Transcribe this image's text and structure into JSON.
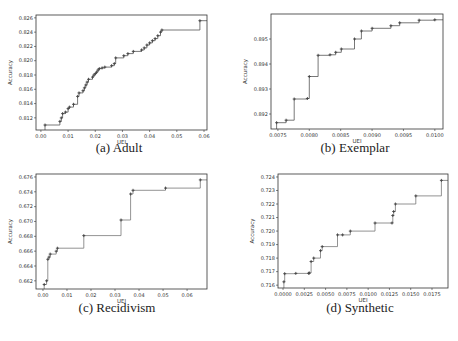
{
  "figure": {
    "panels": [
      {
        "id": "a",
        "caption": "(a) Adult",
        "xlabel": "UEI",
        "ylabel": "Accuracy"
      },
      {
        "id": "b",
        "caption": "(b) Exemplar",
        "xlabel": "UEI",
        "ylabel": "Accuracy"
      },
      {
        "id": "c",
        "caption": "(c) Recidivism",
        "xlabel": "UEI",
        "ylabel": "Accuracy"
      },
      {
        "id": "d",
        "caption": "(d) Synthetic",
        "xlabel": "UEI",
        "ylabel": "Accuracy"
      }
    ]
  },
  "chart_data": [
    {
      "type": "line",
      "step": "post",
      "markers": true,
      "title": "(a) Adult",
      "xlabel": "UEI",
      "ylabel": "Accuracy",
      "xlim": [
        -0.0018,
        0.0611
      ],
      "ylim": [
        0.8103,
        0.8264
      ],
      "xticks": [
        0.0,
        0.01,
        0.02,
        0.03,
        0.04,
        0.05,
        0.06
      ],
      "xtick_labels": [
        "0.00",
        "0.01",
        "0.02",
        "0.03",
        "0.04",
        "0.05",
        "0.06"
      ],
      "yticks": [
        0.812,
        0.814,
        0.816,
        0.818,
        0.82,
        0.822,
        0.824,
        0.826
      ],
      "ytick_labels": [
        "0.812",
        "0.814",
        "0.816",
        "0.818",
        "0.820",
        "0.822",
        "0.824",
        "0.826"
      ],
      "grid": false,
      "color": "#555555",
      "x": [
        0.0015,
        0.007,
        0.0075,
        0.008,
        0.009,
        0.01,
        0.0105,
        0.012,
        0.0135,
        0.014,
        0.0155,
        0.016,
        0.0165,
        0.017,
        0.0175,
        0.019,
        0.0195,
        0.02,
        0.0205,
        0.021,
        0.0215,
        0.0225,
        0.0235,
        0.026,
        0.027,
        0.0275,
        0.0305,
        0.032,
        0.034,
        0.037,
        0.038,
        0.039,
        0.04,
        0.041,
        0.042,
        0.043,
        0.044,
        0.0445,
        0.0585,
        0.0611
      ],
      "y": [
        0.811,
        0.8115,
        0.812,
        0.8126,
        0.8128,
        0.8133,
        0.8135,
        0.8139,
        0.815,
        0.8155,
        0.8158,
        0.8162,
        0.8166,
        0.817,
        0.8174,
        0.8177,
        0.818,
        0.8182,
        0.8184,
        0.8187,
        0.8189,
        0.819,
        0.8191,
        0.8193,
        0.8196,
        0.8204,
        0.8207,
        0.821,
        0.8213,
        0.8215,
        0.8218,
        0.8222,
        0.8225,
        0.8228,
        0.8231,
        0.8235,
        0.824,
        0.8243,
        0.8256,
        0.8256
      ]
    },
    {
      "type": "line",
      "step": "post",
      "markers": true,
      "title": "(b) Exemplar",
      "xlabel": "UEI",
      "ylabel": "Accuracy",
      "xlim": [
        0.00739,
        0.01013
      ],
      "ylim": [
        0.8914,
        0.896
      ],
      "xticks": [
        0.0075,
        0.008,
        0.0085,
        0.009,
        0.0095,
        0.01
      ],
      "xtick_labels": [
        "0.0075",
        "0.0080",
        "0.0085",
        "0.0090",
        "0.0095",
        "0.0100"
      ],
      "yticks": [
        0.892,
        0.893,
        0.894,
        0.895
      ],
      "ytick_labels": [
        "0.892",
        "0.893",
        "0.894",
        "0.895"
      ],
      "grid": false,
      "color": "#555555",
      "x": [
        0.00748,
        0.00763,
        0.00776,
        0.00797,
        0.008,
        0.00814,
        0.00833,
        0.00842,
        0.00851,
        0.00872,
        0.00883,
        0.009,
        0.0093,
        0.00944,
        0.00975,
        0.01,
        0.01013
      ],
      "y": [
        0.89165,
        0.89175,
        0.8926,
        0.89262,
        0.8935,
        0.89435,
        0.89437,
        0.89447,
        0.8946,
        0.895,
        0.89532,
        0.89543,
        0.89553,
        0.89565,
        0.89575,
        0.89577,
        0.89577
      ]
    },
    {
      "type": "line",
      "step": "post",
      "markers": true,
      "title": "(c) Recidivism",
      "xlabel": "UEI",
      "ylabel": "Accuracy",
      "xlim": [
        -0.0029,
        0.0683
      ],
      "ylim": [
        0.6609,
        0.6764
      ],
      "xticks": [
        0.0,
        0.01,
        0.02,
        0.03,
        0.04,
        0.05,
        0.06
      ],
      "xtick_labels": [
        "0.00",
        "0.01",
        "0.02",
        "0.03",
        "0.04",
        "0.05",
        "0.06"
      ],
      "yticks": [
        0.662,
        0.664,
        0.666,
        0.668,
        0.67,
        0.672,
        0.674,
        0.676
      ],
      "ytick_labels": [
        "0.662",
        "0.664",
        "0.666",
        "0.668",
        "0.670",
        "0.672",
        "0.674",
        "0.676"
      ],
      "grid": false,
      "color": "#777777",
      "x": [
        0.0005,
        0.0015,
        0.002,
        0.0025,
        0.003,
        0.0055,
        0.006,
        0.017,
        0.0325,
        0.0365,
        0.0375,
        0.051,
        0.0655,
        0.0683
      ],
      "y": [
        0.6615,
        0.662,
        0.6649,
        0.6652,
        0.6656,
        0.666,
        0.6664,
        0.6681,
        0.6702,
        0.6737,
        0.6742,
        0.6745,
        0.6756,
        0.6756
      ]
    },
    {
      "type": "line",
      "step": "post",
      "markers": true,
      "title": "(d) Synthetic",
      "xlabel": "UEI",
      "ylabel": "Accuracy",
      "xlim": [
        -0.00059,
        0.01938
      ],
      "ylim": [
        0.71579,
        0.72422
      ],
      "xticks": [
        0.0,
        0.0025,
        0.005,
        0.0075,
        0.01,
        0.0125,
        0.015,
        0.0175
      ],
      "xtick_labels": [
        "0.0000",
        "0.0025",
        "0.0050",
        "0.0075",
        "0.0100",
        "0.0125",
        "0.0150",
        "0.0175"
      ],
      "yticks": [
        0.716,
        0.717,
        0.718,
        0.719,
        0.72,
        0.721,
        0.722,
        0.723,
        0.724
      ],
      "ytick_labels": [
        "0.716",
        "0.717",
        "0.718",
        "0.719",
        "0.720",
        "0.721",
        "0.722",
        "0.723",
        "0.724"
      ],
      "grid": false,
      "color": "#777777",
      "x": [
        0.0001,
        0.0002,
        0.0015,
        0.003,
        0.0031,
        0.0033,
        0.0036,
        0.0044,
        0.0046,
        0.0064,
        0.007,
        0.0079,
        0.0108,
        0.0128,
        0.0129,
        0.013,
        0.0132,
        0.0156,
        0.0186,
        0.01938
      ],
      "y": [
        0.71625,
        0.71685,
        0.71687,
        0.71688,
        0.7169,
        0.71775,
        0.718,
        0.71855,
        0.71885,
        0.71972,
        0.71972,
        0.72,
        0.7206,
        0.7206,
        0.72115,
        0.72145,
        0.722,
        0.7226,
        0.72375,
        0.72375
      ]
    }
  ]
}
